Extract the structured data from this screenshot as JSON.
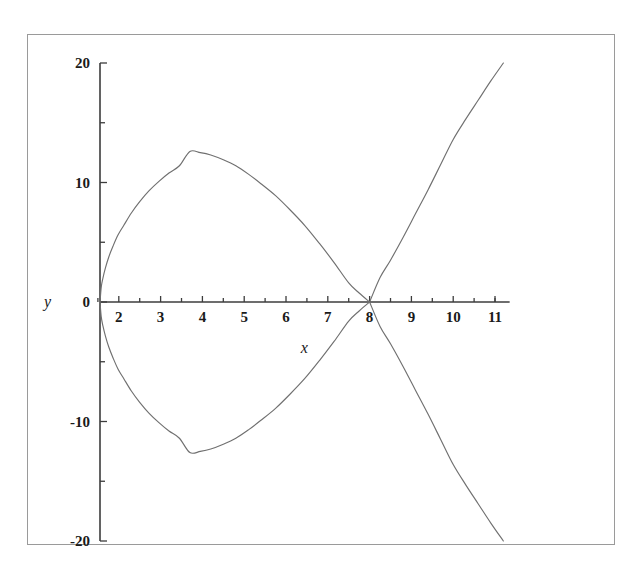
{
  "figure": {
    "background_color": "#ffffff",
    "frame_color": "#9a9a9a",
    "curve_color": "#707070",
    "axis_color": "#3c3c3c",
    "text_color": "#1a1a1a"
  },
  "axes": {
    "x_name": "x",
    "y_name": "y",
    "x_ticks": [
      {
        "label": "2",
        "value": 2
      },
      {
        "label": "3",
        "value": 3
      },
      {
        "label": "4",
        "value": 4
      },
      {
        "label": "5",
        "value": 5
      },
      {
        "label": "6",
        "value": 6
      },
      {
        "label": "7",
        "value": 7
      },
      {
        "label": "8",
        "value": 8
      },
      {
        "label": "9",
        "value": 9
      },
      {
        "label": "10",
        "value": 10
      },
      {
        "label": "11",
        "value": 11
      }
    ],
    "y_ticks": [
      {
        "label": "20",
        "value": 20
      },
      {
        "label": "10",
        "value": 10
      },
      {
        "label": "0",
        "value": 0
      },
      {
        "label": "-10",
        "value": -10
      },
      {
        "label": "-20",
        "value": -20
      }
    ],
    "x_minor_ticks": [
      1.5,
      2.5,
      3.5,
      4.5,
      5.5,
      6.5,
      7.5,
      8.5,
      9.5,
      10.5,
      11
    ],
    "y_minor_ticks": [
      15,
      5,
      -5,
      -15
    ]
  },
  "chart_data": {
    "type": "line",
    "title": "",
    "subtitle": "",
    "xlabel": "x",
    "ylabel": "y",
    "xlim": [
      1.3,
      11.35
    ],
    "ylim": [
      -20,
      20
    ],
    "grid": false,
    "legend": null,
    "annotations": [
      {
        "text": "node (self-intersection)",
        "x": 8,
        "y": 0
      },
      {
        "text": "x-axis crossing",
        "x": 1.55,
        "y": 0
      },
      {
        "text": "loop maximum",
        "x": 3.7,
        "y": 12.8
      },
      {
        "text": "loop minimum",
        "x": 3.7,
        "y": -12.8
      }
    ],
    "equation": "y^2 = (x - 8)^2 * (x - 1.55)",
    "series": [
      {
        "name": "upper-branch",
        "x": [
          1.55,
          1.58,
          1.62,
          1.68,
          1.76,
          1.86,
          1.98,
          2.12,
          2.3,
          2.5,
          2.72,
          2.96,
          3.2,
          3.45,
          3.7,
          3.95,
          4.2,
          4.5,
          4.8,
          5.1,
          5.4,
          5.75,
          6.1,
          6.45,
          6.8,
          7.15,
          7.5,
          7.75,
          8.0
        ],
        "y": [
          0.0,
          1.25,
          2.0,
          2.85,
          3.77,
          4.66,
          5.6,
          6.42,
          7.45,
          8.4,
          9.3,
          10.1,
          10.8,
          11.4,
          12.6,
          12.5,
          12.3,
          11.9,
          11.4,
          10.7,
          9.9,
          8.9,
          7.7,
          6.4,
          4.9,
          3.3,
          1.6,
          0.75,
          0.0
        ],
        "description": "upper half of the loop from the x-intercept to the node"
      },
      {
        "name": "lower-branch",
        "x": [
          1.55,
          1.58,
          1.62,
          1.68,
          1.76,
          1.86,
          1.98,
          2.12,
          2.3,
          2.5,
          2.72,
          2.96,
          3.2,
          3.45,
          3.7,
          3.95,
          4.2,
          4.5,
          4.8,
          5.1,
          5.4,
          5.75,
          6.1,
          6.45,
          6.8,
          7.15,
          7.5,
          7.75,
          8.0
        ],
        "y": [
          0.0,
          -1.25,
          -2.0,
          -2.85,
          -3.77,
          -4.66,
          -5.6,
          -6.42,
          -7.45,
          -8.4,
          -9.3,
          -10.1,
          -10.8,
          -11.4,
          -12.6,
          -12.5,
          -12.3,
          -11.9,
          -11.4,
          -10.7,
          -9.9,
          -8.9,
          -7.7,
          -6.4,
          -4.9,
          -3.3,
          -1.6,
          -0.75,
          0.0
        ],
        "description": "lower half of the loop, mirror of the upper branch"
      },
      {
        "name": "right-upper-branch",
        "x": [
          8.0,
          8.25,
          8.5,
          8.8,
          9.1,
          9.4,
          9.7,
          10.0,
          10.3,
          10.6,
          10.9,
          11.2
        ],
        "y": [
          0.0,
          2.05,
          3.5,
          5.4,
          7.4,
          9.4,
          11.5,
          13.6,
          15.3,
          16.9,
          18.5,
          20.0
        ],
        "description": "right branch rising to +20 at the plot edge"
      },
      {
        "name": "right-lower-branch",
        "x": [
          8.0,
          8.25,
          8.5,
          8.8,
          9.1,
          9.4,
          9.7,
          10.0,
          10.3,
          10.6,
          10.9,
          11.2
        ],
        "y": [
          0.0,
          -2.05,
          -3.5,
          -5.4,
          -7.4,
          -9.4,
          -11.5,
          -13.6,
          -15.3,
          -16.9,
          -18.5,
          -20.0
        ],
        "description": "right branch falling to -20 at the plot edge"
      }
    ]
  }
}
